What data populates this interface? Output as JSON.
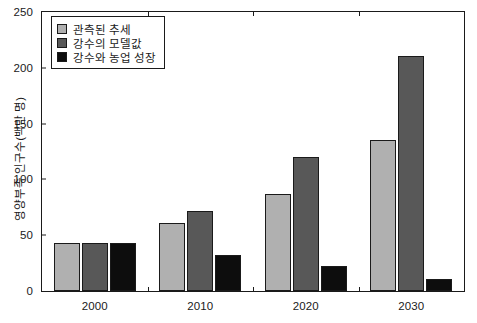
{
  "chart_data": {
    "type": "bar",
    "title": "",
    "xlabel": "",
    "ylabel": "영양부족 인구수(백만 명)",
    "categories": [
      "2000",
      "2010",
      "2020",
      "2030"
    ],
    "series": [
      {
        "name": "관측된 추세",
        "color": "#b0b0b0",
        "values": [
          43,
          61,
          87,
          135
        ]
      },
      {
        "name": "강수의 모델값",
        "color": "#585858",
        "values": [
          43,
          72,
          120,
          211
        ]
      },
      {
        "name": "강수와 농업 성장",
        "color": "#0d0d0d",
        "values": [
          43,
          32,
          22,
          11
        ]
      }
    ],
    "ylim": [
      0,
      250
    ],
    "yticks": [
      0,
      50,
      100,
      150,
      200,
      250
    ],
    "ytick_labels": [
      "0",
      "50",
      "100",
      "150",
      "200",
      "250"
    ],
    "grid": false,
    "legend_position": "top-left",
    "axis_color": "#1a1a1a",
    "background": "#ffffff"
  }
}
